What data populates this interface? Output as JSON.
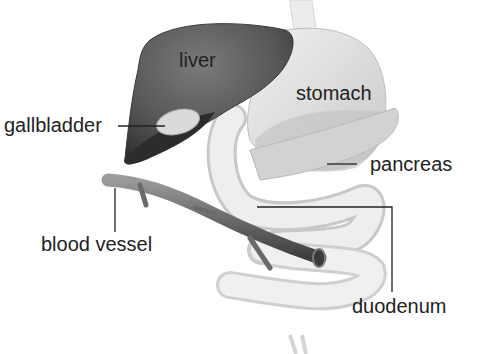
{
  "diagram": {
    "type": "anatomical-illustration",
    "labels": {
      "liver": "liver",
      "stomach": "stomach",
      "gallbladder": "gallbladder",
      "pancreas": "pancreas",
      "blood_vessel": "blood vessel",
      "duodenum": "duodenum"
    },
    "colors": {
      "liver": "#5a5a5a",
      "liver_dark": "#2e2e2e",
      "stomach": "#dcdcdc",
      "pancreas": "#c8c8c8",
      "duodenum": "#e6e6e6",
      "blood_vessel": "#6e6e6e",
      "gallbladder": "#d8d8d8",
      "leader_line": "#222222",
      "text": "#222222"
    }
  }
}
